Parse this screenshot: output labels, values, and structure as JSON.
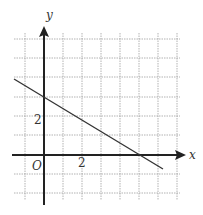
{
  "figure": {
    "type": "coordinate-grid-line-graph",
    "axes": {
      "x_label": "x",
      "y_label": "y",
      "origin_label": "O",
      "x_tick_label": "2",
      "y_tick_label": "2"
    },
    "grid": {
      "x_range": [
        -1,
        7
      ],
      "y_range": [
        -3,
        6
      ],
      "step": 1,
      "style": "dotted"
    },
    "line": {
      "equation": "y = 3 - 0.6x",
      "y_intercept": 3,
      "x_intercept": 5,
      "color": "#333333"
    },
    "colors": {
      "grid": "#999999",
      "axes": "#222222",
      "background": "#ffffff"
    }
  }
}
